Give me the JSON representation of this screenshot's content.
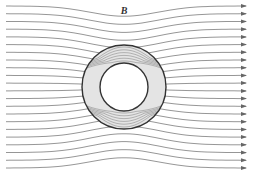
{
  "figure": {
    "field_label": "B",
    "colors": {
      "field_line": "#8a8a8a",
      "shield_fill": "#e4e4e4",
      "shield_edge": "#333333",
      "inner_line": "#9a9a9a",
      "background": "#ffffff"
    },
    "external_field_line_count": 22,
    "internal_field_line_count": 12,
    "arrow_direction": "right"
  }
}
